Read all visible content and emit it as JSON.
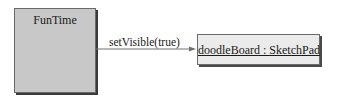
{
  "diagram": {
    "type": "uml-collaboration",
    "objects": [
      {
        "id": "funtime",
        "label": "FunTime"
      },
      {
        "id": "doodleBoard",
        "label": "doodleBoard : SketchPad"
      }
    ],
    "messages": [
      {
        "from": "funtime",
        "to": "doodleBoard",
        "label": "setVisible(true)"
      }
    ]
  },
  "colors": {
    "funtime_fill": "#c8c8c8",
    "object_fill": "#ebebeb",
    "border": "#6a6a6a",
    "line": "#707070"
  }
}
